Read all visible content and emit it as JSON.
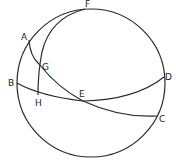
{
  "diagram": {
    "type": "spherical-geometry",
    "colors": {
      "line": "#2a2a2a",
      "background": "#ffffff"
    },
    "labels": {
      "A": "A",
      "B": "B",
      "C": "C",
      "D": "D",
      "E": "E",
      "F": "F",
      "G": "G",
      "H": "H"
    },
    "arcs": [
      "AGEC",
      "BHED",
      "FGH",
      "outer-circle"
    ]
  }
}
